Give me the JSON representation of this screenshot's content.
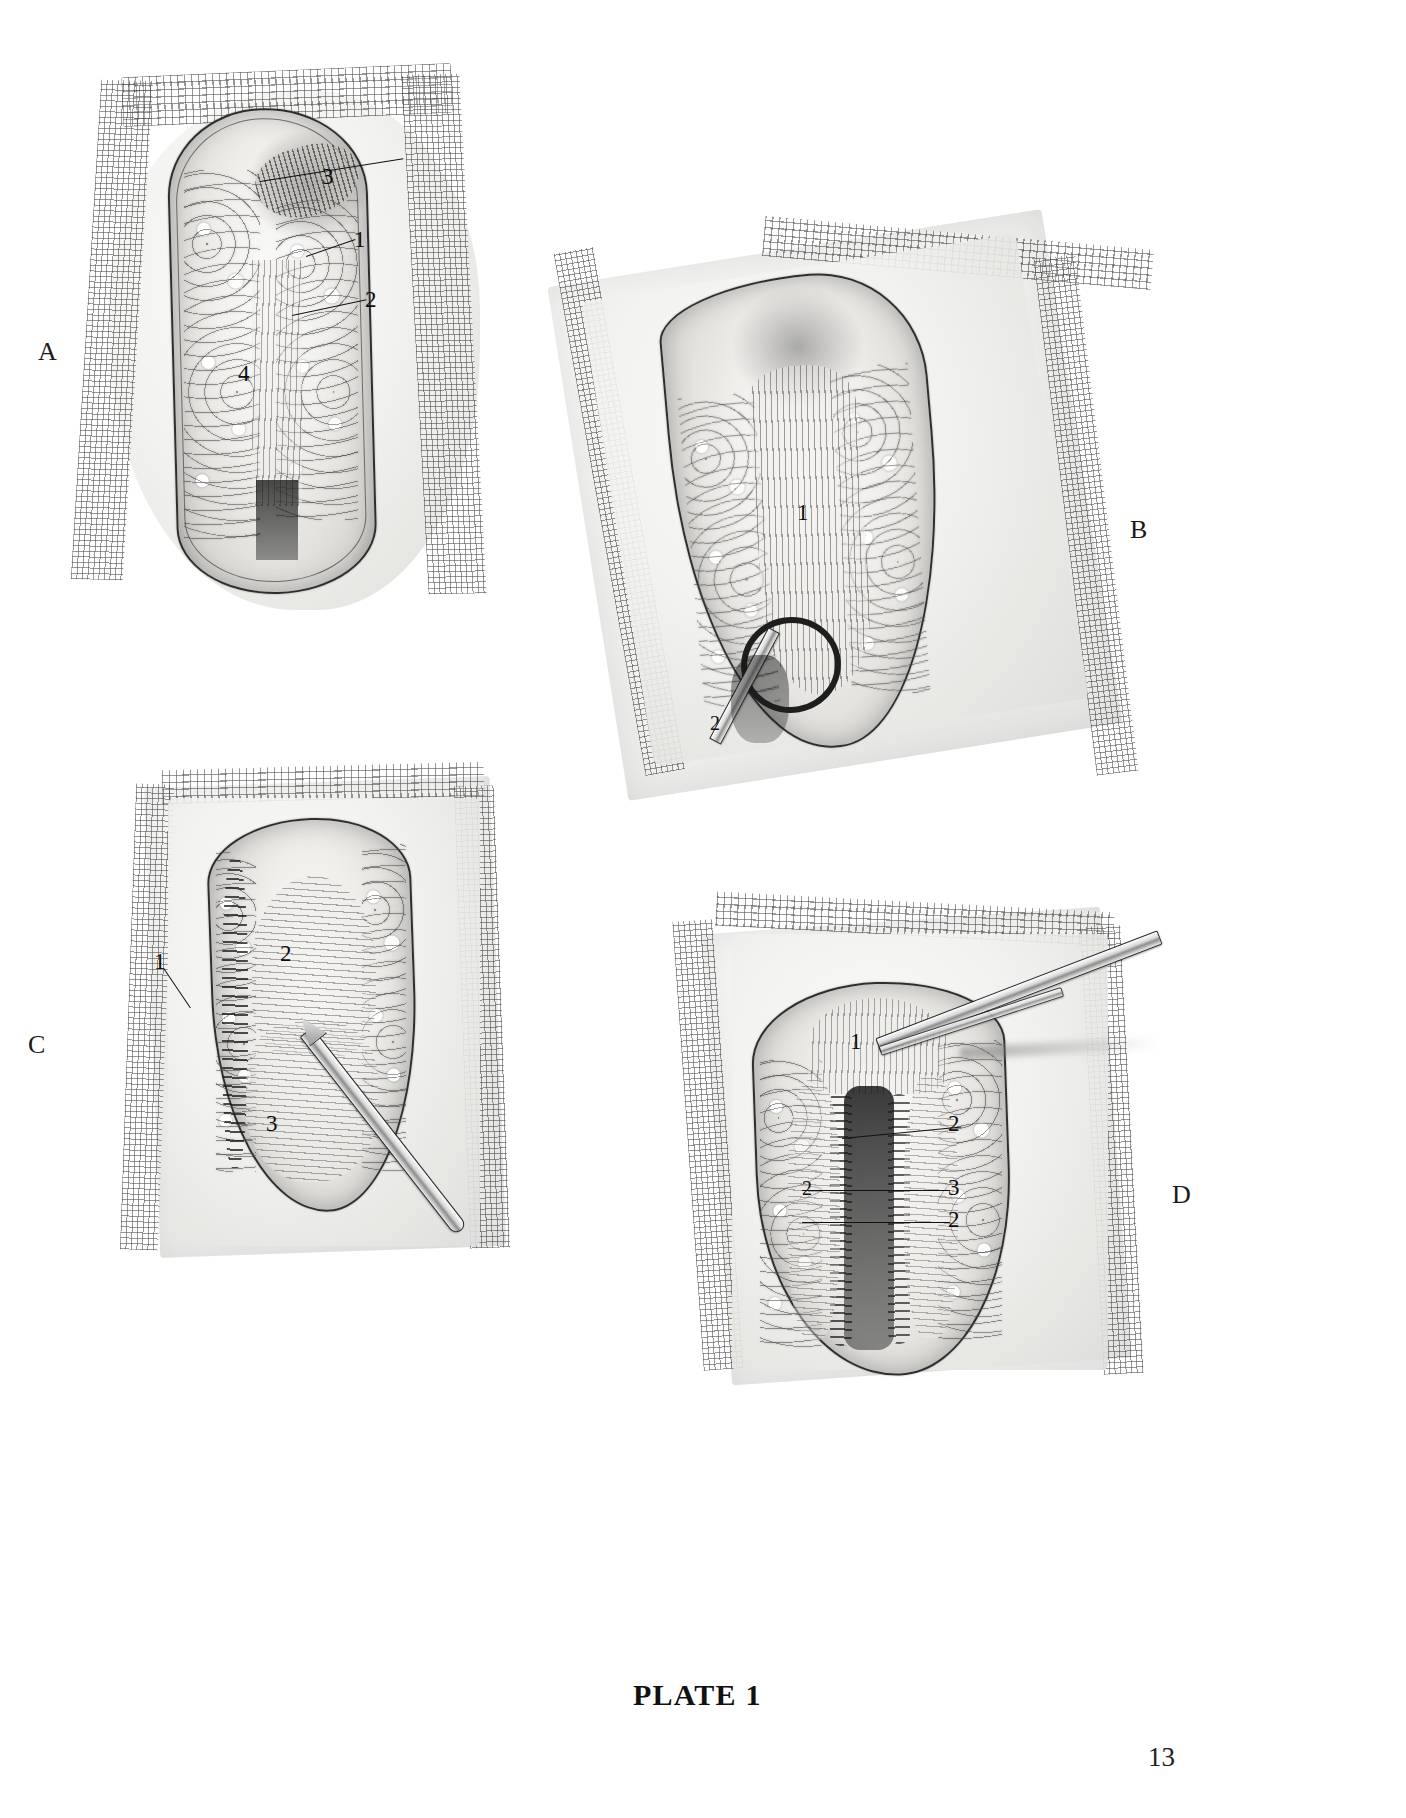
{
  "document": {
    "type": "surgical-atlas-plate",
    "plate_caption": "PLATE 1",
    "page_number": "13",
    "background_color": "#ffffff",
    "ink_color": "#111111"
  },
  "panels": [
    {
      "id": "A",
      "letter": "A",
      "title": "Panel A",
      "description": "Midline incision exposing subcutaneous fat and linea alba with towel drapes",
      "labels": [
        {
          "number": "3",
          "has_leader": true
        },
        {
          "number": "1",
          "has_leader": true
        },
        {
          "number": "2",
          "has_leader": true
        },
        {
          "number": "4",
          "has_leader": false
        }
      ]
    },
    {
      "id": "B",
      "letter": "B",
      "title": "Panel B",
      "description": "Oblique wound with rectus sheath exposed and a clamp in the inferior angle",
      "labels": [
        {
          "number": "1",
          "has_leader": false
        },
        {
          "number": "2",
          "has_leader": false
        }
      ]
    },
    {
      "id": "C",
      "letter": "C",
      "title": "Panel C",
      "description": "Wound with scalpel dividing fascia, fat edge and muscle bellies shown",
      "labels": [
        {
          "number": "1",
          "has_leader": true
        },
        {
          "number": "2",
          "has_leader": false
        },
        {
          "number": "3",
          "has_leader": false
        }
      ]
    },
    {
      "id": "D",
      "letter": "D",
      "title": "Panel D",
      "description": "Deep exposure with forceps elevating tissue; peritoneal layers labelled",
      "labels": [
        {
          "number": "1",
          "has_leader": false
        },
        {
          "number": "2",
          "has_leader": true
        },
        {
          "number": "3",
          "has_leader": true
        },
        {
          "number": "2",
          "has_leader": true
        },
        {
          "number": "2",
          "has_leader": false
        }
      ]
    }
  ],
  "instruments": {
    "clamp_label": "hemostat-clamp",
    "scalpel_label": "scalpel",
    "forceps_label": "forceps"
  }
}
